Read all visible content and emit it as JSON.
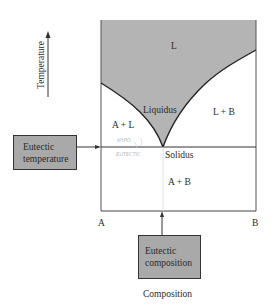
{
  "diagram": {
    "type": "eutectic phase diagram",
    "axes": {
      "y_label": "Temperature",
      "x_label": "Composition",
      "x_left": "A",
      "x_right": "B"
    },
    "regions": {
      "liquid": "L",
      "a_plus_l": "A + L",
      "l_plus_b": "L + B",
      "a_plus_b": "A + B"
    },
    "lines": {
      "liquidus": "Liquidus",
      "solidus": "Solidus"
    },
    "callouts": {
      "eutectic_temperature_line1": "Eutectic",
      "eutectic_temperature_line2": "temperature",
      "eutectic_composition_line1": "Eutectic",
      "eutectic_composition_line2": "composition"
    },
    "annotations": {
      "hand_top": "HYPO",
      "hand_bottom": "EUTECTIC"
    },
    "colors": {
      "liquid_fill": "#b4b4b4",
      "box_fill": "#a9a9a9",
      "line": "#2a2a2a"
    }
  }
}
